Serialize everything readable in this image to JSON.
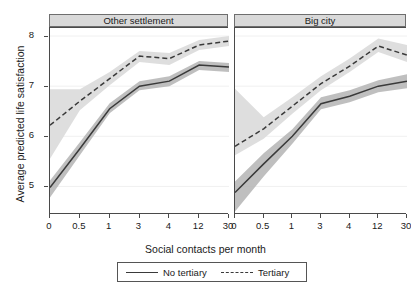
{
  "chart_data": {
    "type": "line",
    "title": "",
    "xlabel": "Social contacts per month",
    "ylabel": "Average predicted life satisfaction",
    "categories": [
      "0",
      "0.5",
      "1",
      "3",
      "4",
      "12",
      "30"
    ],
    "yticks": [
      "5",
      "6",
      "7",
      "8"
    ],
    "ylim": [
      4.45,
      8.18
    ],
    "grid": "horizontal-light",
    "legend": {
      "position": "bottom",
      "entries": [
        {
          "label": "No tertiary",
          "style": "solid"
        },
        {
          "label": "Tertiary",
          "style": "dashed"
        }
      ]
    },
    "panels": [
      {
        "title": "Other settlement",
        "series": [
          {
            "name": "No tertiary",
            "style": "solid",
            "values": [
              4.98,
              5.75,
              6.55,
              7.0,
              7.1,
              7.42,
              7.38
            ],
            "ci_lower": [
              4.78,
              5.62,
              6.46,
              6.92,
              7.0,
              7.32,
              7.28
            ],
            "ci_upper": [
              5.12,
              5.88,
              6.66,
              7.1,
              7.2,
              7.5,
              7.46
            ]
          },
          {
            "name": "Tertiary",
            "style": "dashed",
            "values": [
              6.22,
              6.7,
              7.15,
              7.6,
              7.55,
              7.82,
              7.9
            ],
            "ci_lower": [
              5.55,
              6.52,
              7.02,
              7.48,
              7.42,
              7.72,
              7.8
            ],
            "ci_upper": [
              6.94,
              6.94,
              7.28,
              7.7,
              7.66,
              7.92,
              8.0
            ]
          }
        ]
      },
      {
        "title": "Big city",
        "series": [
          {
            "name": "No tertiary",
            "style": "solid",
            "values": [
              4.88,
              5.45,
              6.0,
              6.65,
              6.8,
              7.0,
              7.1
            ],
            "ci_lower": [
              4.5,
              5.2,
              5.85,
              6.54,
              6.68,
              6.88,
              6.96
            ],
            "ci_upper": [
              5.1,
              5.66,
              6.14,
              6.78,
              6.92,
              7.12,
              7.24
            ]
          },
          {
            "name": "Tertiary",
            "style": "dashed",
            "values": [
              5.8,
              6.15,
              6.6,
              7.05,
              7.4,
              7.8,
              7.62
            ],
            "ci_lower": [
              5.62,
              5.95,
              6.45,
              6.92,
              7.28,
              7.68,
              7.48
            ],
            "ci_upper": [
              6.95,
              6.38,
              6.78,
              7.2,
              7.55,
              7.95,
              7.82
            ]
          }
        ]
      }
    ],
    "colors": {
      "line": "#3a3a3a",
      "band_light": "#dcdcdc",
      "band_dark": "#b4b4b4",
      "panel_header": "#d9d9d9",
      "axis": "#4a4a4a",
      "gridline": "#f0f0f0"
    }
  }
}
